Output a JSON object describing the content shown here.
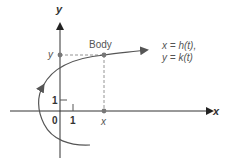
{
  "diagram": {
    "axes": {
      "x_label": "x",
      "y_label": "y",
      "origin_label": "0",
      "x_tick_label": "1",
      "y_tick_label": "1"
    },
    "body": {
      "label": "Body",
      "x_projection_label": "x",
      "y_projection_label": "y"
    },
    "equations": {
      "line1": "x = h(t),",
      "line2": "y = k(t)"
    },
    "colors": {
      "axis": "#333333",
      "curve": "#555555",
      "dashed": "#777777",
      "point": "#777777",
      "text": "#555555"
    }
  }
}
